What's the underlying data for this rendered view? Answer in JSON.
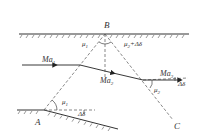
{
  "diagram": {
    "type": "supersonic-flow-expansion-wave-reflection",
    "points": {
      "A": "A",
      "B": "B",
      "C": "C"
    },
    "flow_labels": {
      "incoming": "Ma",
      "incoming_sub": "1",
      "middle": "Ma",
      "middle_sub": "2",
      "outgoing": "Ma",
      "outgoing_sub": "3"
    },
    "angle_labels": {
      "mu1_top": "μ",
      "mu1_top_sub": "1",
      "mu2_top": "μ",
      "mu2_top_sub": "2",
      "mu2_top_suffix": "+Δδ",
      "mu1_bottom": "μ",
      "mu1_bottom_sub": "1",
      "delta_bottom": "Δδ",
      "mu2_right": "μ",
      "mu2_right_sub": "2",
      "delta_right": "Δδ"
    },
    "colors": {
      "line": "#333333",
      "dashed": "#555555",
      "background": "#ffffff"
    }
  }
}
